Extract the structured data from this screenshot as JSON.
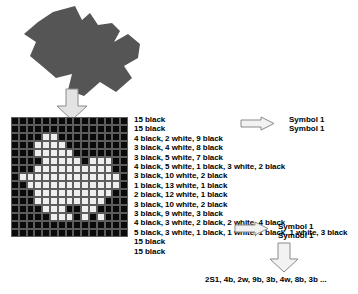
{
  "diagram": {
    "source_shape": {
      "icon": "irregular-blob-shape",
      "fill": "#555555"
    },
    "arrows": {
      "blob_to_grid": "down-arrow-icon",
      "rle_to_symbol_top": "right-arrow-icon",
      "rle_to_symbol_bottom": "right-arrow-icon",
      "symbol_to_output": "down-arrow-icon"
    },
    "bitmap": {
      "columns": 15,
      "rows": 15,
      "black_color": "#0a0a0a",
      "white_color": "#eeeeee",
      "grid_line_color": "#5d5d5d",
      "runs": [
        [
          [
            "b",
            15
          ]
        ],
        [
          [
            "b",
            15
          ]
        ],
        [
          [
            "b",
            4
          ],
          [
            "w",
            2
          ],
          [
            "b",
            9
          ]
        ],
        [
          [
            "b",
            3
          ],
          [
            "w",
            4
          ],
          [
            "b",
            8
          ]
        ],
        [
          [
            "b",
            3
          ],
          [
            "w",
            5
          ],
          [
            "b",
            7
          ]
        ],
        [
          [
            "b",
            4
          ],
          [
            "w",
            5
          ],
          [
            "b",
            1
          ],
          [
            "w",
            3
          ],
          [
            "b",
            2
          ]
        ],
        [
          [
            "b",
            3
          ],
          [
            "w",
            10
          ],
          [
            "b",
            2
          ]
        ],
        [
          [
            "b",
            1
          ],
          [
            "w",
            13
          ],
          [
            "b",
            1
          ]
        ],
        [
          [
            "b",
            2
          ],
          [
            "w",
            12
          ],
          [
            "b",
            1
          ]
        ],
        [
          [
            "b",
            3
          ],
          [
            "w",
            10
          ],
          [
            "b",
            2
          ]
        ],
        [
          [
            "b",
            3
          ],
          [
            "w",
            9
          ],
          [
            "b",
            3
          ]
        ],
        [
          [
            "b",
            4
          ],
          [
            "w",
            3
          ],
          [
            "b",
            2
          ],
          [
            "w",
            2
          ],
          [
            "b",
            4
          ]
        ],
        [
          [
            "b",
            5
          ],
          [
            "w",
            3
          ],
          [
            "b",
            1
          ],
          [
            "w",
            1
          ],
          [
            "b",
            1
          ],
          [
            "w",
            1
          ],
          [
            "b",
            3
          ]
        ],
        [
          [
            "b",
            15
          ]
        ],
        [
          [
            "b",
            15
          ]
        ]
      ]
    },
    "rle_lines": [
      "15 black",
      "15 black",
      "4 black, 2 white, 9 black",
      "3 black, 4 white, 8 black",
      "3 black, 5 white, 7 black",
      "4 black, 5 white, 1 black, 3 white, 2 black",
      "3 black, 10 white, 2 black",
      "1 black, 13 white, 1 black",
      "2 black, 12 white, 1 black",
      "3 black, 10 white, 2 black",
      "3 black, 9 white, 3 black",
      "4 black, 3 white, 2 black, 2 white, 4 black",
      "5 black, 3 white, 1 black, 1 white, 1 black, 1 white, 3 black",
      "15 black",
      "15 black"
    ],
    "symbols": {
      "top_first": "Symbol 1",
      "top_second": "Symbol 1",
      "bottom_first": "Symbol 1",
      "bottom_second": "Symbol 1"
    },
    "output_string": "2S1, 4b, 2w, 9b, 3b, 4w, 8b, 3b ..."
  }
}
